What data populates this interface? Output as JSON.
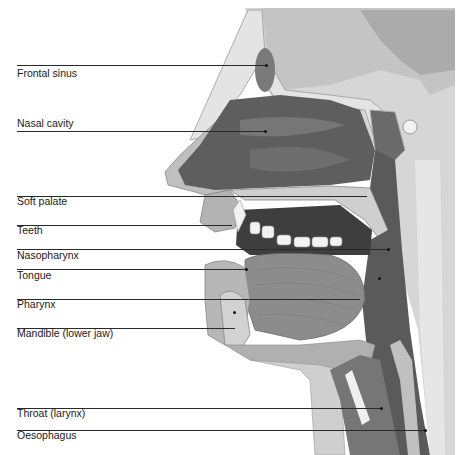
{
  "diagram": {
    "type": "anatomical-cross-section",
    "colors": {
      "background": "#ffffff",
      "tissue_dark": "#5e5e5e",
      "tissue_mid": "#9a9a9a",
      "tissue_light": "#c8c8c8",
      "bone": "#d9d9d9",
      "line": "#2a2a2a"
    },
    "labels": [
      {
        "id": "frontal-sinus",
        "text": "Frontal sinus",
        "line_y": 65,
        "text_y": 68,
        "end_x": 266
      },
      {
        "id": "nasal-cavity",
        "text": "Nasal cavity",
        "line_y": 131,
        "text_y": 117,
        "end_x": 266
      },
      {
        "id": "soft-palate",
        "text": "Soft palate",
        "line_y": 196,
        "text_y": 195,
        "end_x": 370
      },
      {
        "id": "teeth",
        "text": "Teeth",
        "line_y": 225,
        "text_y": 224,
        "end_x": 232
      },
      {
        "id": "nasopharynx",
        "text": "Nasopharynx",
        "line_y": 249,
        "text_y": 249,
        "end_x": 388
      },
      {
        "id": "tongue",
        "text": "Tongue",
        "line_y": 269,
        "text_y": 269,
        "end_x": 246
      },
      {
        "id": "pharynx",
        "text": "Pharynx",
        "line_y": 299,
        "text_y": 298,
        "end_x": 360
      },
      {
        "id": "mandible",
        "text": "Mandible (lower jaw)",
        "line_y": 328,
        "text_y": 327,
        "end_x": 235
      },
      {
        "id": "throat",
        "text": "Throat (larynx)",
        "line_y": 408,
        "text_y": 407,
        "end_x": 382
      },
      {
        "id": "oesophagus",
        "text": "Oesophagus",
        "line_y": 430,
        "text_y": 429,
        "end_x": 426
      }
    ]
  }
}
